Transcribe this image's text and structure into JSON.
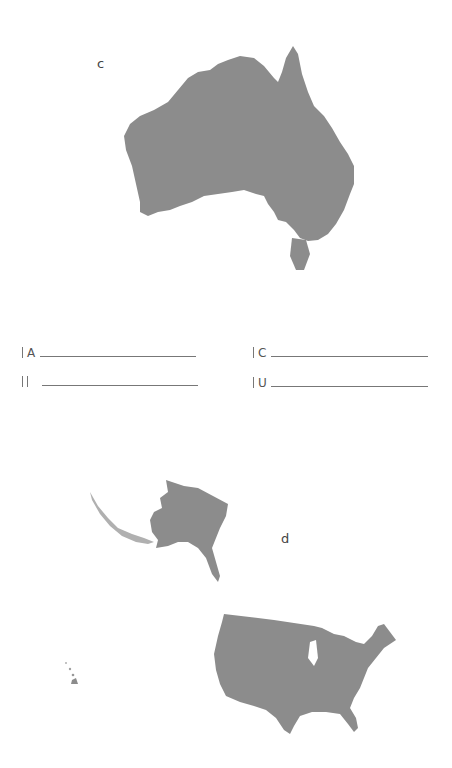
{
  "page": {
    "labels": {
      "australia": "c",
      "usa": "d"
    },
    "map_fill": "#8c8c8c",
    "answer_rows": [
      {
        "prefix": "|",
        "letter": "A"
      },
      {
        "prefix": "|",
        "letter": "C"
      },
      {
        "prefix": "||",
        "letter": ""
      },
      {
        "prefix": "|",
        "letter": "U"
      }
    ]
  }
}
